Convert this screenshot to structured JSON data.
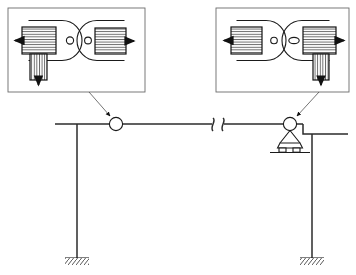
{
  "diagram": {
    "type": "engineering-schematic",
    "colors": {
      "line": "#1a1a1a",
      "thin_line": "#3a3a3a",
      "frame": "#6b6b6b",
      "background": "#ffffff",
      "hatch": "#2b2b2b"
    }
  },
  "detail_boxes": [
    {
      "id": "left-detail",
      "label": "",
      "position": "top-left",
      "x": 8,
      "y": 8,
      "width": 137,
      "height": 84,
      "points_to": "left-bearing",
      "elements": {
        "left_block_arrow": "left",
        "right_block_arrow": "right",
        "vertical_block_arrow": "down",
        "vertical_block_side": "left",
        "hatch_left": "horizontal",
        "hatch_right": "horizontal",
        "hatch_vertical": "vertical"
      }
    },
    {
      "id": "right-detail",
      "label": "",
      "position": "top-right",
      "x": 216,
      "y": 8,
      "width": 133,
      "height": 84,
      "points_to": "right-bearing",
      "elements": {
        "left_block_arrow": "left",
        "right_block_arrow": "right",
        "vertical_block_arrow": "down",
        "vertical_block_side": "right",
        "hatch_left": "horizontal",
        "hatch_right": "horizontal",
        "hatch_vertical": "vertical"
      }
    }
  ],
  "structure": {
    "beam": {
      "label": "",
      "y": 124,
      "x_start": 55,
      "x_end": 348,
      "break_symbol": true,
      "break_x": 218
    },
    "columns": [
      {
        "id": "left-column",
        "x": 77,
        "y_top": 124,
        "y_bottom": 258,
        "support": "fixed-ground"
      },
      {
        "id": "right-column",
        "x": 312,
        "y_top": 134,
        "y_bottom": 258,
        "support": "fixed-ground"
      }
    ],
    "bearings": [
      {
        "id": "left-bearing",
        "type": "pin",
        "cx": 116,
        "cy": 124,
        "r": 6.5,
        "has_pedestal": false
      },
      {
        "id": "right-bearing",
        "type": "rocker-roller",
        "cx": 290,
        "cy": 124,
        "r": 6.5,
        "has_pedestal": true
      }
    ],
    "ground_supports": [
      {
        "id": "left-ground",
        "x": 77,
        "y": 258,
        "width": 24
      },
      {
        "id": "right-ground",
        "x": 312,
        "y": 258,
        "width": 24
      }
    ]
  },
  "leader_lines": [
    {
      "id": "left-leader",
      "from_x": 90,
      "from_y": 92,
      "to_x": 112,
      "to_y": 117,
      "arrowhead": true
    },
    {
      "id": "right-leader",
      "from_x": 318,
      "from_y": 92,
      "to_x": 296,
      "to_y": 117,
      "arrowhead": true
    }
  ]
}
